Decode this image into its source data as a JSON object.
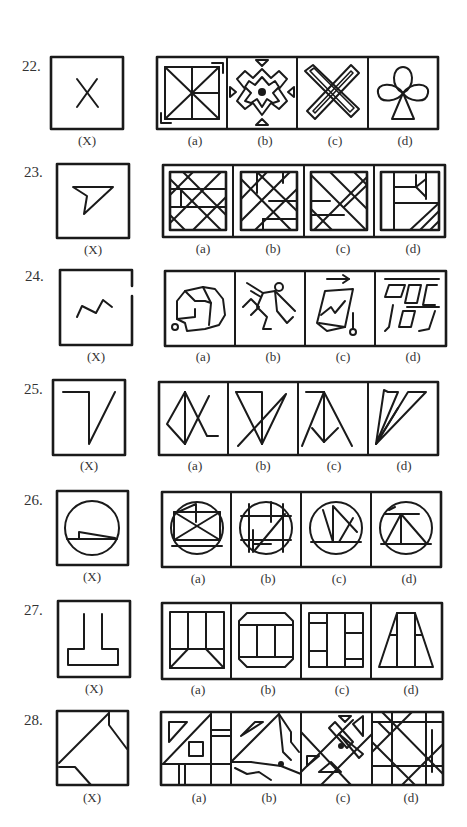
{
  "questions": [
    {
      "number": "22.",
      "question_figure": {
        "label": "(X)",
        "shape": "x-cross"
      },
      "options": [
        {
          "label": "(a)",
          "shape": "square-with-diagonals-and-corner-arrows"
        },
        {
          "label": "(b)",
          "shape": "cross-with-center-dot-and-triangles"
        },
        {
          "label": "(c)",
          "shape": "interlocked-x-bands"
        },
        {
          "label": "(d)",
          "shape": "club-clover"
        }
      ]
    },
    {
      "number": "23.",
      "question_figure": {
        "label": "(X)",
        "shape": "funnel-triangle"
      },
      "options": [
        {
          "label": "(a)",
          "shape": "diagonal-lattice-a"
        },
        {
          "label": "(b)",
          "shape": "diagonal-lattice-b"
        },
        {
          "label": "(c)",
          "shape": "diagonal-lattice-c"
        },
        {
          "label": "(d)",
          "shape": "panels-with-hatched-corner"
        }
      ]
    },
    {
      "number": "24.",
      "question_figure": {
        "label": "(X)",
        "shape": "zigzag-line"
      },
      "options": [
        {
          "label": "(a)",
          "shape": "helmet-like-polygon"
        },
        {
          "label": "(b)",
          "shape": "running-figure"
        },
        {
          "label": "(c)",
          "shape": "parallelogram-with-arrow-and-pin"
        },
        {
          "label": "(d)",
          "shape": "slanted-grid-blocks"
        }
      ]
    },
    {
      "number": "25.",
      "question_figure": {
        "label": "(X)",
        "shape": "hooked-v"
      },
      "options": [
        {
          "label": "(a)",
          "shape": "kite-with-tail"
        },
        {
          "label": "(b)",
          "shape": "inverted-triangle-crossed"
        },
        {
          "label": "(c)",
          "shape": "peak-with-w"
        },
        {
          "label": "(d)",
          "shape": "converging-wedges"
        }
      ]
    },
    {
      "number": "26.",
      "question_figure": {
        "label": "(X)",
        "shape": "circle-with-wedge-chord"
      },
      "options": [
        {
          "label": "(a)",
          "shape": "circle-with-boxed-x"
        },
        {
          "label": "(b)",
          "shape": "circle-with-grid-lines"
        },
        {
          "label": "(c)",
          "shape": "circle-with-zigzag"
        },
        {
          "label": "(d)",
          "shape": "circle-with-triangle-on-bar"
        }
      ]
    },
    {
      "number": "27.",
      "question_figure": {
        "label": "(X)",
        "shape": "inverted-t-outline"
      },
      "options": [
        {
          "label": "(a)",
          "shape": "square-with-t-and-corner-wedges"
        },
        {
          "label": "(b)",
          "shape": "octagon-with-columns"
        },
        {
          "label": "(c)",
          "shape": "square-with-panels"
        },
        {
          "label": "(d)",
          "shape": "trapezoid-with-columns"
        }
      ]
    },
    {
      "number": "28.",
      "question_figure": {
        "label": "(X)",
        "shape": "square-with-diagonal-and-cut-corners"
      },
      "options": [
        {
          "label": "(a)",
          "shape": "grid-with-triangle-and-square"
        },
        {
          "label": "(b)",
          "shape": "diagonals-with-scribbles"
        },
        {
          "label": "(c)",
          "shape": "diagonal-bands-with-triangles"
        },
        {
          "label": "(d)",
          "shape": "star-lattice"
        }
      ]
    }
  ]
}
